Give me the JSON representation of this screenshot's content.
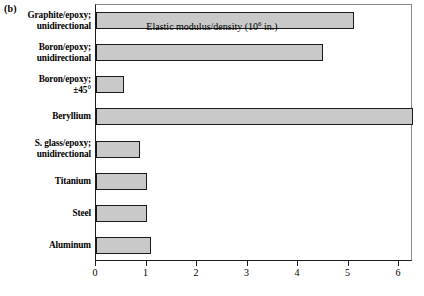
{
  "figure": {
    "panel_label": "(b)"
  },
  "chart_data": {
    "type": "bar",
    "orientation": "horizontal",
    "title": "",
    "xlabel": "Elastic modulus/density (10^6 in.)",
    "xlabel_prefix": "Elastic modulus/density (10",
    "xlabel_exponent": "6",
    "xlabel_suffix": " in.)",
    "ylabel": "",
    "xlim": [
      0,
      6.3
    ],
    "xticks": [
      0,
      1,
      2,
      3,
      4,
      5,
      6
    ],
    "xtick_labels": [
      "0",
      "1",
      "2",
      "3",
      "4",
      "5",
      "6"
    ],
    "grid": false,
    "legend": "none",
    "bar_fill": "#c9c9c9",
    "bar_edge": "#1a1a1a",
    "categories": [
      "Graphite/epoxy; unidirectional",
      "Boron/epoxy; unidirectional",
      "Boron/epoxy; ±45°",
      "Beryllium",
      "S. glass/epoxy; unidirectional",
      "Titanium",
      "Steel",
      "Aluminum"
    ],
    "category_lines": [
      [
        "Graphite/epoxy;",
        "unidirectional"
      ],
      [
        "Boron/epoxy;",
        "unidirectional"
      ],
      [
        "Boron/epoxy;",
        "±45°"
      ],
      [
        "Beryllium",
        ""
      ],
      [
        "S. glass/epoxy;",
        "unidirectional"
      ],
      [
        "Titanium",
        ""
      ],
      [
        "Steel",
        ""
      ],
      [
        "Aluminum",
        ""
      ]
    ],
    "values": [
      5.1,
      4.5,
      0.55,
      6.28,
      0.87,
      1.0,
      1.0,
      1.09
    ]
  }
}
